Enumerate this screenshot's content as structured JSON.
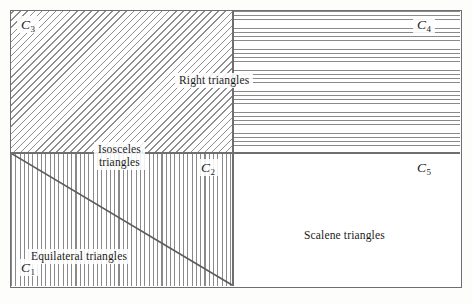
{
  "diagram": {
    "regions": [
      {
        "id": "c3",
        "tag": "C",
        "subscript": "3",
        "hatch": "diagonal-lines",
        "position": "top-left",
        "fill_color": "#8f8f8f"
      },
      {
        "id": "c4",
        "tag": "C",
        "subscript": "4",
        "hatch": "horizontal-lines",
        "position": "top-right",
        "fill_color": "#8a8a8a"
      },
      {
        "id": "c2",
        "tag": "C",
        "subscript": "2",
        "hatch": "vertical-lines",
        "position": "bottom-left",
        "fill_color": "#8a8a8a"
      },
      {
        "id": "c5",
        "tag": "C",
        "subscript": "5",
        "hatch": "none",
        "position": "bottom-right",
        "fill_color": "#ffffff"
      },
      {
        "id": "c1",
        "tag": "C",
        "subscript": "1",
        "hatch": "vertical-lines",
        "position": "bottom-left-triangle",
        "fill_color": "#8a8a8a"
      }
    ],
    "set_labels": {
      "right_triangles": "Right triangles",
      "isosceles_triangles_line1": "Isosceles",
      "isosceles_triangles_line2": "triangles",
      "equilateral_triangles": "Equilateral triangles",
      "scalene_triangles": "Scalene triangles"
    },
    "colors": {
      "border": "#6f6f6f",
      "hatch": "#8a8a8a",
      "background": "#ffffff",
      "text": "#1b1b1b"
    }
  }
}
